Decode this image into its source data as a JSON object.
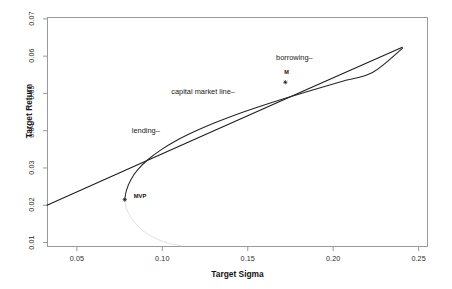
{
  "chart_data": {
    "type": "line",
    "title": "",
    "xlabel": "Target Sigma",
    "ylabel": "Target Return",
    "xlim": [
      0.0325,
      0.2555
    ],
    "ylim": [
      0.0088,
      0.0705
    ],
    "grid": false,
    "legend": "none",
    "xticks": [
      "0.05",
      "0.10",
      "0.15",
      "0.20",
      "0.25"
    ],
    "xtick_values": [
      0.05,
      0.1,
      0.15,
      0.2,
      0.25
    ],
    "yticks": [
      "0.01",
      "0.02",
      "0.03",
      "0.04",
      "0.05",
      "0.06",
      "0.07"
    ],
    "ytick_values": [
      0.01,
      0.02,
      0.03,
      0.04,
      0.05,
      0.06,
      0.07
    ],
    "series": [
      {
        "name": "capital market line",
        "type": "line",
        "color": "#1a1a1a",
        "x": [
          0.0325,
          0.078,
          0.12,
          0.172,
          0.21,
          0.2405
        ],
        "y": [
          0.02,
          0.0293,
          0.0379,
          0.0485,
          0.0562,
          0.0624
        ]
      },
      {
        "name": "efficient frontier",
        "type": "line",
        "color": "#262626",
        "x": [
          0.078,
          0.079,
          0.0815,
          0.0855,
          0.0915,
          0.099,
          0.108,
          0.1185,
          0.13,
          0.143,
          0.157,
          0.172,
          0.188,
          0.205,
          0.223,
          0.2405
        ],
        "y": [
          0.0215,
          0.024,
          0.0268,
          0.0295,
          0.0322,
          0.0348,
          0.0373,
          0.0397,
          0.042,
          0.0443,
          0.0465,
          0.0487,
          0.0509,
          0.0532,
          0.0556,
          0.0621
        ]
      },
      {
        "name": "inefficient frontier",
        "type": "line",
        "color": "#e2e2e2",
        "x": [
          0.078,
          0.079,
          0.0815,
          0.0855,
          0.091,
          0.0975,
          0.1045,
          0.1115
        ],
        "y": [
          0.0215,
          0.0192,
          0.0168,
          0.0145,
          0.0124,
          0.0108,
          0.0097,
          0.0091
        ]
      }
    ],
    "points": [
      {
        "label": "MVP",
        "x": 0.078,
        "y": 0.0215,
        "marker": "asterisk",
        "label_dx": 9,
        "label_dy": -3
      },
      {
        "label": "M",
        "x": 0.172,
        "y": 0.053,
        "marker": "asterisk",
        "label_dx": -1,
        "label_dy": -9
      }
    ],
    "annotations": [
      {
        "text": "lending–",
        "x": 0.0985,
        "y": 0.04,
        "anchor": "end"
      },
      {
        "text": "capital market line–",
        "x": 0.1425,
        "y": 0.0503,
        "anchor": "end"
      },
      {
        "text": "borrowing–",
        "x": 0.188,
        "y": 0.0596,
        "anchor": "end"
      }
    ],
    "watermark": "Rmetrics/fPortfolio"
  }
}
